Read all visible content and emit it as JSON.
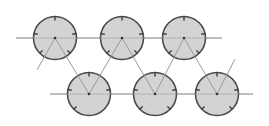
{
  "diagram": {
    "width": 269,
    "height": 126,
    "colors": {
      "background": "#ffffff",
      "circle_fill": "#d3d3d3",
      "circle_stroke": "#4a4a4a",
      "line": "#9a9a9a",
      "tick": "#3a3a3a",
      "center_dot": "#333333"
    },
    "radius": 21.5,
    "top_row": {
      "y": 38,
      "line_x1": 16,
      "line_x2": 222,
      "circles": [
        {
          "cx": 55,
          "ticks": [
            90,
            168,
            12,
            225,
            315
          ]
        },
        {
          "cx": 122,
          "ticks": [
            90,
            168,
            12,
            225,
            315
          ]
        },
        {
          "cx": 184,
          "ticks": [
            90,
            168,
            12,
            225,
            315
          ]
        }
      ]
    },
    "bottom_row": {
      "y": 94,
      "line_x1": 50,
      "line_x2": 253,
      "circles": [
        {
          "cx": 89,
          "ticks": [
            90,
            168,
            12,
            225
          ]
        },
        {
          "cx": 155,
          "ticks": [
            90,
            168,
            12,
            225,
            315
          ]
        },
        {
          "cx": 217,
          "ticks": [
            90,
            168,
            12,
            225,
            315
          ]
        }
      ]
    },
    "zigzag": [
      [
        37,
        70
      ],
      [
        55,
        38
      ],
      [
        89,
        94
      ],
      [
        122,
        38
      ],
      [
        155,
        94
      ],
      [
        184,
        38
      ],
      [
        217,
        94
      ],
      [
        235,
        59
      ]
    ]
  }
}
